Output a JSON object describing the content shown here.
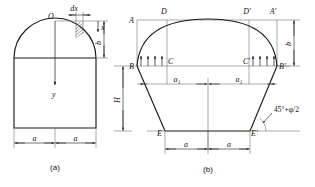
{
  "figure": {
    "title_visible": false,
    "background_color": "#ffffff",
    "line_color": "#1a1a1a",
    "panels": [
      {
        "id": "panel-a",
        "caption": "(a)",
        "description": "Arched roof cross-section with coordinate origin at crown",
        "labels": {
          "origin": "O",
          "y_axis": "y",
          "x_axis": "x",
          "element_width": "dx",
          "arch_rise": "b",
          "wall_height": "H",
          "half_span_left": "a",
          "half_span_right": "a"
        }
      },
      {
        "id": "panel-b",
        "caption": "(b)",
        "description": "Pressure arch failure zone with slip planes",
        "points": {
          "top_left": "A",
          "top_left_inner": "D",
          "top_right_inner": "D'",
          "top_right": "A'",
          "mid_left": "B",
          "mid_left_inner": "C",
          "mid_right_inner": "C'",
          "mid_right": "B'",
          "bottom_left": "E",
          "bottom_right": "E'"
        },
        "labels": {
          "arch_rise": "b",
          "half_width_left": "a₁",
          "half_width_right": "a₁",
          "half_span_left": "a",
          "half_span_right": "a",
          "slip_angle": "45°+φ/2"
        }
      }
    ]
  }
}
